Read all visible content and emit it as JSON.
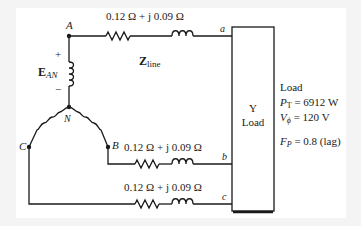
{
  "diagram": {
    "type": "three-phase-wye-circuit",
    "source": {
      "nodes": {
        "A": "A",
        "B": "B",
        "C": "C",
        "N": "N"
      },
      "voltage_label_main": "E",
      "voltage_label_sub": "AN",
      "plus": "+",
      "minus": "−"
    },
    "line": {
      "impedance_label_main": "Z",
      "impedance_label_sub": "line",
      "phase_a_impedance": "0.12 Ω + j 0.09 Ω",
      "phase_b_impedance": "0.12 Ω + j 0.09 Ω",
      "phase_c_impedance": "0.12 Ω + j 0.09 Ω",
      "terminal_a": "a",
      "terminal_b": "b",
      "terminal_c": "c"
    },
    "load_box": {
      "line1": "Y",
      "line2": "Load"
    },
    "load_specs": {
      "title": "Load",
      "pt_sym": "P",
      "pt_sub": "T",
      "pt_value": " = 6912 W",
      "vphi_sym": "V",
      "vphi_sub": "ϕ",
      "vphi_value": " = 120 V",
      "fp_sym": "F",
      "fp_sub": "P",
      "fp_value": " = 0.8 (lag)"
    },
    "colors": {
      "line": "#1a1a1a",
      "background": "#ffffff"
    }
  }
}
